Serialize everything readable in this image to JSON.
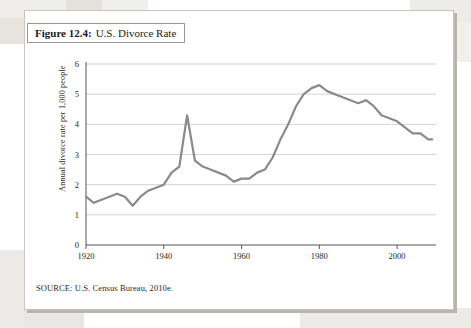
{
  "figure": {
    "number_label": "Figure 12.4:",
    "title": "U.S. Divorce Rate",
    "source": "SOURCE: U.S. Census Bureau, 2010e."
  },
  "colors": {
    "line": "#8a8a8a",
    "grid": "#c8c8c8",
    "axis": "#555555",
    "card_border": "#c9c6c0",
    "title_border": "#9b9891",
    "text": "#1f1f1f"
  },
  "chart_data": {
    "type": "line",
    "title": "U.S. Divorce Rate",
    "xlabel": "",
    "ylabel": "Annual divorce rate per 1,000 people",
    "xlim": [
      1920,
      2010
    ],
    "ylim": [
      0,
      6
    ],
    "xticks": [
      1920,
      1940,
      1960,
      1980,
      2000
    ],
    "yticks": [
      0,
      1,
      2,
      3,
      4,
      5,
      6
    ],
    "grid": true,
    "legend": "none",
    "series": [
      {
        "name": "Annual divorce rate per 1,000 people",
        "x": [
          1920,
          1922,
          1924,
          1926,
          1928,
          1930,
          1932,
          1934,
          1936,
          1938,
          1940,
          1942,
          1944,
          1946,
          1948,
          1950,
          1952,
          1954,
          1956,
          1958,
          1960,
          1962,
          1964,
          1966,
          1968,
          1970,
          1972,
          1974,
          1976,
          1978,
          1980,
          1982,
          1984,
          1986,
          1988,
          1990,
          1992,
          1994,
          1996,
          1998,
          2000,
          2002,
          2004,
          2006,
          2008,
          2009
        ],
        "values": [
          1.6,
          1.4,
          1.5,
          1.6,
          1.7,
          1.6,
          1.3,
          1.6,
          1.8,
          1.9,
          2.0,
          2.4,
          2.6,
          4.3,
          2.8,
          2.6,
          2.5,
          2.4,
          2.3,
          2.1,
          2.2,
          2.2,
          2.4,
          2.5,
          2.9,
          3.5,
          4.0,
          4.6,
          5.0,
          5.2,
          5.3,
          5.1,
          5.0,
          4.9,
          4.8,
          4.7,
          4.8,
          4.6,
          4.3,
          4.2,
          4.1,
          3.9,
          3.7,
          3.7,
          3.5,
          3.5
        ]
      }
    ]
  }
}
